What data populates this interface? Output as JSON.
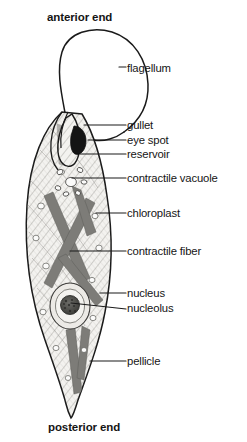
{
  "figure": {
    "organism": "Euglena",
    "orientation_labels": {
      "anterior": "anterior end",
      "posterior": "posterior end"
    },
    "colors": {
      "background": "#ffffff",
      "outline": "#1a1a1a",
      "cytoplasm": "#f2f1ee",
      "hatching": "#8e8d88",
      "chloroplast": "#7d7d79",
      "eye_spot": "#141414",
      "nucleus_fill": "#e8e7e3",
      "nucleolus": "#4a4a47",
      "leader_line": "#1a1a1a",
      "text": "#151515"
    },
    "labels": [
      {
        "id": "flagellum",
        "text": "flagellum",
        "x": 127,
        "y": 70,
        "leader": "dash"
      },
      {
        "id": "gullet",
        "text": "gullet",
        "x": 127,
        "y": 128,
        "leader": "line"
      },
      {
        "id": "eye-spot",
        "text": "eye spot",
        "x": 127,
        "y": 143,
        "leader": "line"
      },
      {
        "id": "reservoir",
        "text": "reservoir",
        "x": 127,
        "y": 157,
        "leader": "line"
      },
      {
        "id": "contractile-vacuole",
        "text": "contractile  vacuole",
        "x": 127,
        "y": 181,
        "leader": "line"
      },
      {
        "id": "chloroplast",
        "text": "chloroplast",
        "x": 127,
        "y": 216,
        "leader": "line"
      },
      {
        "id": "contractile-fiber",
        "text": "contractile fiber",
        "x": 127,
        "y": 254,
        "leader": "line"
      },
      {
        "id": "nucleus",
        "text": "nucleus",
        "x": 127,
        "y": 296,
        "leader": "line"
      },
      {
        "id": "nucleolus",
        "text": "nucleolus",
        "x": 127,
        "y": 311,
        "leader": "diagonal"
      },
      {
        "id": "pellicle",
        "text": "pellicle",
        "x": 127,
        "y": 364,
        "leader": "line"
      }
    ],
    "structures": [
      {
        "name": "flagellum",
        "description": "long whip-like loop extending from anterior end"
      },
      {
        "name": "reservoir",
        "description": "flask-shaped cavity at anterior end"
      },
      {
        "name": "gullet",
        "description": "narrow canal opening to reservoir"
      },
      {
        "name": "eye-spot",
        "description": "dark pigment spot beside reservoir"
      },
      {
        "name": "contractile-vacuole",
        "description": "ring of small vacuoles below reservoir"
      },
      {
        "name": "chloroplast",
        "description": "elongated bands crossing the cytoplasm"
      },
      {
        "name": "contractile-fiber",
        "description": "striations running along the body"
      },
      {
        "name": "nucleus",
        "description": "large oval body in mid-posterior region"
      },
      {
        "name": "nucleolus",
        "description": "granular sphere inside the nucleus"
      },
      {
        "name": "pellicle",
        "description": "flexible outer covering of the cell"
      }
    ]
  }
}
